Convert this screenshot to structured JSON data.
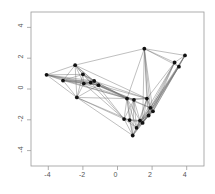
{
  "figure": {
    "title": "",
    "background_color": "#ffffff",
    "frame_color": "#9a9a9a",
    "node_color": "#111111",
    "edge_color": "#6f6f6f"
  },
  "axes": {
    "x_ticks": [
      "-4",
      "-2",
      "0",
      "2",
      "4"
    ],
    "y_ticks": [
      "4",
      "2",
      "0",
      "-2",
      "-4"
    ],
    "xlabel": "",
    "ylabel": ""
  },
  "chart_data": {
    "type": "scatter",
    "title": "",
    "xlabel": "",
    "ylabel": "",
    "xlim": [
      -5.0,
      5.0
    ],
    "ylim": [
      -5.0,
      5.0
    ],
    "grid": false,
    "legend": null,
    "x_tick_values": [
      -4,
      -2,
      0,
      2,
      4
    ],
    "y_tick_values": [
      4,
      2,
      0,
      -2,
      -4
    ],
    "nodes": [
      {
        "id": 0,
        "x": -4.1,
        "y": 0.92
      },
      {
        "id": 1,
        "x": -3.15,
        "y": 0.55
      },
      {
        "id": 2,
        "x": -2.45,
        "y": 1.55
      },
      {
        "id": 3,
        "x": -2.0,
        "y": 0.95
      },
      {
        "id": 4,
        "x": -1.95,
        "y": 0.35
      },
      {
        "id": 5,
        "x": -1.55,
        "y": 0.42
      },
      {
        "id": 6,
        "x": -1.35,
        "y": 0.52
      },
      {
        "id": 7,
        "x": -2.35,
        "y": -0.55
      },
      {
        "id": 8,
        "x": -1.1,
        "y": 0.25
      },
      {
        "id": 9,
        "x": 1.55,
        "y": 2.62
      },
      {
        "id": 10,
        "x": 3.9,
        "y": 2.18
      },
      {
        "id": 11,
        "x": 3.3,
        "y": 1.72
      },
      {
        "id": 12,
        "x": 3.55,
        "y": 1.45
      },
      {
        "id": 13,
        "x": 0.55,
        "y": -0.62
      },
      {
        "id": 14,
        "x": 0.95,
        "y": -0.7
      },
      {
        "id": 15,
        "x": 1.7,
        "y": -0.62
      },
      {
        "id": 16,
        "x": 1.9,
        "y": -1.22
      },
      {
        "id": 17,
        "x": 2.05,
        "y": -1.45
      },
      {
        "id": 18,
        "x": 1.8,
        "y": -1.72
      },
      {
        "id": 19,
        "x": 0.38,
        "y": -1.95
      },
      {
        "id": 20,
        "x": 0.7,
        "y": -2.02
      },
      {
        "id": 21,
        "x": 1.3,
        "y": -2.05
      },
      {
        "id": 22,
        "x": 1.45,
        "y": -2.2
      },
      {
        "id": 23,
        "x": 1.1,
        "y": -2.52
      },
      {
        "id": 24,
        "x": 0.88,
        "y": -3.02
      }
    ],
    "edges": [
      [
        0,
        1
      ],
      [
        0,
        2
      ],
      [
        0,
        3
      ],
      [
        0,
        4
      ],
      [
        0,
        5
      ],
      [
        0,
        6
      ],
      [
        0,
        7
      ],
      [
        0,
        8
      ],
      [
        1,
        2
      ],
      [
        1,
        3
      ],
      [
        1,
        4
      ],
      [
        1,
        5
      ],
      [
        1,
        6
      ],
      [
        1,
        8
      ],
      [
        1,
        7
      ],
      [
        2,
        3
      ],
      [
        2,
        4
      ],
      [
        2,
        5
      ],
      [
        2,
        6
      ],
      [
        2,
        8
      ],
      [
        2,
        9
      ],
      [
        2,
        7
      ],
      [
        3,
        4
      ],
      [
        3,
        5
      ],
      [
        3,
        6
      ],
      [
        3,
        7
      ],
      [
        3,
        8
      ],
      [
        4,
        5
      ],
      [
        4,
        6
      ],
      [
        4,
        7
      ],
      [
        4,
        8
      ],
      [
        4,
        13
      ],
      [
        5,
        6
      ],
      [
        5,
        8
      ],
      [
        5,
        13
      ],
      [
        5,
        14
      ],
      [
        6,
        8
      ],
      [
        6,
        13
      ],
      [
        6,
        15
      ],
      [
        7,
        8
      ],
      [
        7,
        13
      ],
      [
        7,
        19
      ],
      [
        7,
        20
      ],
      [
        7,
        24
      ],
      [
        8,
        13
      ],
      [
        8,
        14
      ],
      [
        8,
        15
      ],
      [
        8,
        16
      ],
      [
        9,
        10
      ],
      [
        9,
        11
      ],
      [
        9,
        12
      ],
      [
        9,
        15
      ],
      [
        9,
        16
      ],
      [
        9,
        17
      ],
      [
        9,
        13
      ],
      [
        10,
        11
      ],
      [
        10,
        12
      ],
      [
        10,
        16
      ],
      [
        10,
        17
      ],
      [
        10,
        18
      ],
      [
        11,
        12
      ],
      [
        11,
        16
      ],
      [
        11,
        17
      ],
      [
        11,
        18
      ],
      [
        11,
        15
      ],
      [
        12,
        16
      ],
      [
        12,
        17
      ],
      [
        12,
        18
      ],
      [
        13,
        14
      ],
      [
        13,
        15
      ],
      [
        13,
        16
      ],
      [
        13,
        19
      ],
      [
        13,
        20
      ],
      [
        13,
        21
      ],
      [
        13,
        23
      ],
      [
        13,
        24
      ],
      [
        14,
        15
      ],
      [
        14,
        19
      ],
      [
        14,
        20
      ],
      [
        14,
        21
      ],
      [
        14,
        23
      ],
      [
        14,
        24
      ],
      [
        15,
        16
      ],
      [
        15,
        17
      ],
      [
        15,
        18
      ],
      [
        15,
        21
      ],
      [
        15,
        22
      ],
      [
        15,
        23
      ],
      [
        16,
        17
      ],
      [
        16,
        18
      ],
      [
        16,
        21
      ],
      [
        16,
        22
      ],
      [
        16,
        23
      ],
      [
        16,
        24
      ],
      [
        17,
        18
      ],
      [
        17,
        21
      ],
      [
        17,
        22
      ],
      [
        17,
        23
      ],
      [
        18,
        21
      ],
      [
        18,
        22
      ],
      [
        18,
        23
      ],
      [
        18,
        24
      ],
      [
        19,
        20
      ],
      [
        19,
        21
      ],
      [
        19,
        23
      ],
      [
        19,
        24
      ],
      [
        20,
        21
      ],
      [
        20,
        22
      ],
      [
        20,
        23
      ],
      [
        20,
        24
      ],
      [
        21,
        22
      ],
      [
        21,
        23
      ],
      [
        21,
        24
      ],
      [
        22,
        23
      ],
      [
        22,
        24
      ],
      [
        23,
        24
      ],
      [
        2,
        15
      ],
      [
        3,
        13
      ],
      [
        1,
        13
      ],
      [
        0,
        13
      ],
      [
        5,
        19
      ],
      [
        6,
        19
      ],
      [
        4,
        19
      ],
      [
        9,
        22
      ],
      [
        10,
        22
      ],
      [
        12,
        22
      ],
      [
        11,
        23
      ],
      [
        9,
        18
      ]
    ]
  }
}
